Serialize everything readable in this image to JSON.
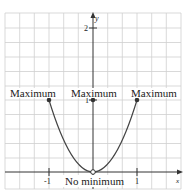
{
  "figure": {
    "function": "y = x^2 on [-1, 1) excluding origin as open point",
    "axes": {
      "x_label": "x",
      "y_label": "y",
      "x_ticks": [
        {
          "value": -1,
          "label": "-1"
        },
        {
          "value": 1,
          "label": "1"
        }
      ],
      "y_ticks": [
        {
          "value": 1,
          "label": "1"
        },
        {
          "value": 2,
          "label": "2"
        }
      ]
    },
    "annotations": {
      "left": "Maximum",
      "center": "Maximum",
      "right": "Maximum",
      "bottom": "No minimum"
    },
    "points": [
      {
        "x": -1,
        "y": 1,
        "type": "closed"
      },
      {
        "x": 0,
        "y": 1,
        "type": "closed"
      },
      {
        "x": 1,
        "y": 1,
        "type": "closed"
      },
      {
        "x": 0,
        "y": 0,
        "type": "open"
      }
    ],
    "colors": {
      "grid": "#c8c8c8",
      "axis": "#333333",
      "curve": "#444444"
    }
  }
}
